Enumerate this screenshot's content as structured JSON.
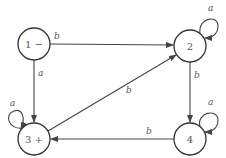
{
  "diagram": {
    "type": "finite-automaton",
    "nodes": [
      {
        "id": "1",
        "label": "1 −",
        "x": 34,
        "y": 44,
        "role": "start"
      },
      {
        "id": "2",
        "label": "2",
        "x": 190,
        "y": 46
      },
      {
        "id": "3",
        "label": "3 +",
        "x": 34,
        "y": 139,
        "role": "final"
      },
      {
        "id": "4",
        "label": "4",
        "x": 190,
        "y": 139
      }
    ],
    "edges": [
      {
        "from": "1",
        "to": "2",
        "label": "b"
      },
      {
        "from": "1",
        "to": "3",
        "label": "a"
      },
      {
        "from": "2",
        "to": "2",
        "label": "a"
      },
      {
        "from": "2",
        "to": "4",
        "label": "b"
      },
      {
        "from": "3",
        "to": "3",
        "label": "a"
      },
      {
        "from": "3",
        "to": "2",
        "label": "b"
      },
      {
        "from": "4",
        "to": "4",
        "label": "a"
      },
      {
        "from": "4",
        "to": "3",
        "label": "b"
      }
    ]
  }
}
